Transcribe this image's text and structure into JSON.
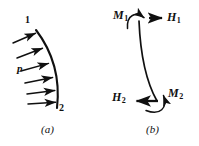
{
  "figure": {
    "background_color": "#ffffff",
    "ink_color": "#101010",
    "width": 199,
    "height": 146
  },
  "panels": [
    {
      "id": "panel-a",
      "caption": "(a)",
      "caption_x": 42,
      "caption_y": 126,
      "labels": [
        {
          "name": "node-label-1",
          "text": "1",
          "x": 26,
          "y": 16,
          "kind": "node"
        },
        {
          "name": "node-label-2",
          "text": "2",
          "x": 59,
          "y": 103,
          "kind": "node"
        },
        {
          "name": "pressure-label-p",
          "text": "p",
          "x": 18,
          "y": 63,
          "kind": "load"
        }
      ],
      "arc": {
        "name": "curved-member-arc",
        "start": [
          36,
          30
        ],
        "control": [
          62,
          64
        ],
        "end": [
          57,
          108
        ],
        "stroke_width": 2.0
      },
      "pressure_arrows": {
        "name": "distributed-pressure-arrows",
        "count": 6,
        "stroke_width": 1.5,
        "items": [
          {
            "x1": 13,
            "y1": 43,
            "x2": 37,
            "y2": 33
          },
          {
            "x1": 17,
            "y1": 58,
            "x2": 44,
            "y2": 48
          },
          {
            "x1": 21,
            "y1": 71,
            "x2": 50,
            "y2": 63
          },
          {
            "x1": 25,
            "y1": 83,
            "x2": 54,
            "y2": 77
          },
          {
            "x1": 27,
            "y1": 94,
            "x2": 56,
            "y2": 90
          },
          {
            "x1": 28,
            "y1": 104,
            "x2": 57,
            "y2": 102
          }
        ]
      }
    },
    {
      "id": "panel-b",
      "caption": "(b)",
      "caption_x": 147,
      "caption_y": 126,
      "labels": [
        {
          "name": "moment-label-m1",
          "text": "M",
          "sub": "1",
          "x": 116,
          "y": 10,
          "kind": "moment"
        },
        {
          "name": "force-label-h1",
          "text": "H",
          "sub": "1",
          "x": 168,
          "y": 12,
          "kind": "force"
        },
        {
          "name": "force-label-h2",
          "text": "H",
          "sub": "2",
          "x": 114,
          "y": 92,
          "kind": "force"
        },
        {
          "name": "moment-label-m2",
          "text": "M",
          "sub": "2",
          "x": 170,
          "y": 88,
          "kind": "moment"
        }
      ],
      "member_curve": {
        "name": "deformed-member-curve",
        "start": [
          139,
          22
        ],
        "control": [
          142,
          72
        ],
        "end": [
          157,
          101
        ],
        "stroke_width": 1.8
      },
      "moment_arrow_top": {
        "name": "moment-arrow-m1",
        "path_start": [
          127,
          28
        ],
        "path_control": [
          130,
          13
        ],
        "path_end": [
          146,
          19
        ],
        "stroke_width": 1.6
      },
      "force_arrow_top": {
        "name": "force-arrow-h1",
        "x1": 149,
        "y1": 18,
        "x2": 164,
        "y2": 18,
        "stroke_width": 2.2
      },
      "force_arrow_bottom": {
        "name": "force-arrow-h2",
        "x1": 158,
        "y1": 101,
        "x2": 134,
        "y2": 101,
        "stroke_width": 2.2
      },
      "moment_arrow_bottom": {
        "name": "moment-arrow-m2",
        "path_start": [
          146,
          112
        ],
        "path_control": [
          168,
          110
        ],
        "path_end": [
          163,
          93
        ],
        "stroke_width": 1.6
      }
    }
  ]
}
